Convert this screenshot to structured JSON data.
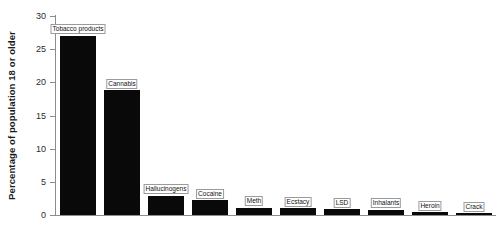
{
  "chart_data": {
    "type": "bar",
    "title": "",
    "xlabel": "",
    "ylabel": "Percentage of population 18 or older",
    "ylim": [
      0,
      30
    ],
    "yticks": [
      0,
      5,
      10,
      15,
      20,
      25,
      30
    ],
    "ytick_labels": [
      "0",
      "5",
      "10",
      "15",
      "20",
      "25",
      "30"
    ],
    "grid": false,
    "legend": false,
    "bar_color": "#090909",
    "background_color": "#ffffff",
    "axis_color": "#8c8c8c",
    "label_style": "boxed labels above each bar",
    "categories": [
      "Tobacco products",
      "Cannabis",
      "Hallucinogens",
      "Cocaine",
      "Meth",
      "Ecstacy",
      "LSD",
      "Inhalants",
      "Heroin",
      "Crack"
    ],
    "values": [
      27.0,
      18.8,
      2.9,
      2.2,
      1.1,
      1.0,
      0.9,
      0.8,
      0.4,
      0.3
    ]
  }
}
